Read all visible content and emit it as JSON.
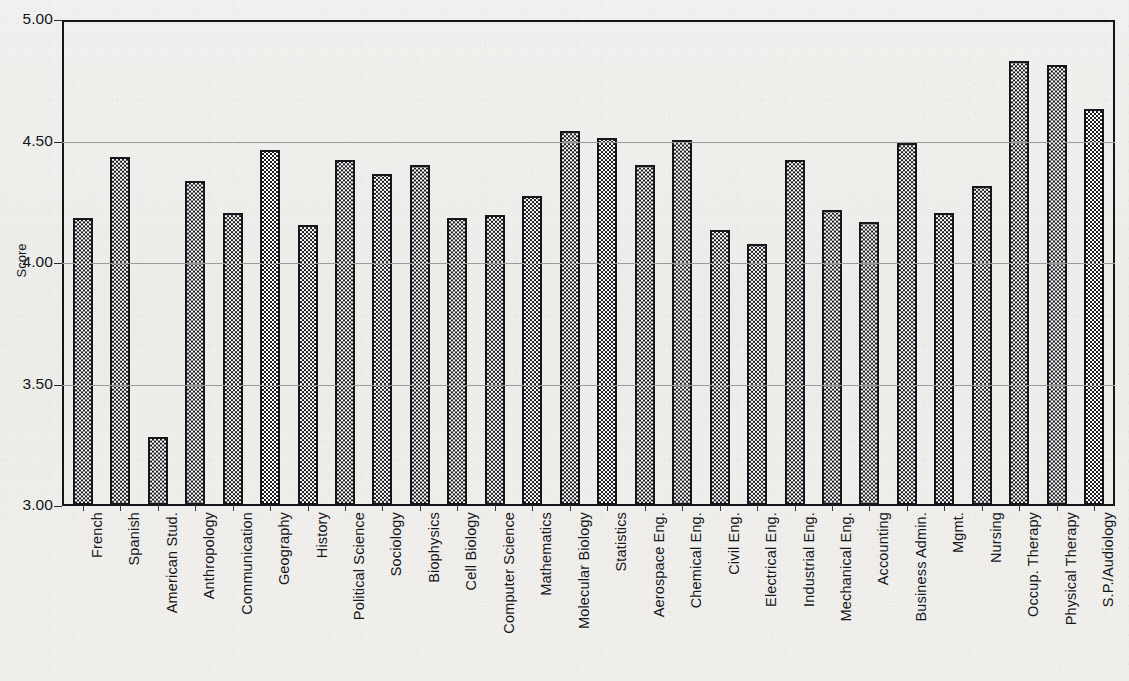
{
  "chart_data": {
    "type": "bar",
    "title": "",
    "xlabel": "",
    "ylabel": "Score",
    "ylim": [
      3.0,
      5.0
    ],
    "ytick_labels": [
      "5.00",
      "4.50",
      "4.00",
      "3.50",
      "3.00"
    ],
    "ytick_values": [
      5.0,
      4.5,
      4.0,
      3.5,
      3.0
    ],
    "grid": true,
    "legend": null,
    "categories": [
      "French",
      "Spanish",
      "American Stud.",
      "Anthropology",
      "Communication",
      "Geography",
      "History",
      "Political  Science",
      "Sociology",
      "Biophysics",
      "Cell Biology",
      "Computer Science",
      "Mathematics",
      "Molecular Biology",
      "Statistics",
      "Aerospace Eng.",
      "Chemical Eng.",
      "Civil Eng.",
      "Electrical Eng.",
      "Industrial Eng.",
      "Mechanical Eng.",
      "Accounting",
      "Business Admin.",
      "Mgmt.",
      "Nursing",
      "Occup. Therapy",
      "Physical Therapy",
      "S.P./Audiology"
    ],
    "values": [
      4.19,
      4.44,
      3.28,
      4.34,
      4.21,
      4.47,
      4.16,
      4.43,
      4.37,
      4.41,
      4.19,
      4.2,
      4.28,
      4.55,
      4.52,
      4.41,
      4.51,
      4.14,
      4.08,
      4.43,
      4.22,
      4.17,
      4.5,
      4.21,
      4.32,
      4.84,
      4.82,
      4.64
    ],
    "bar_style": {
      "fill_pattern": "checkerboard",
      "fill_color": "#1a1b1f",
      "background_color": "#ffffff",
      "border_color": "#16171b"
    }
  },
  "figure": {
    "background_color": "#f0efec",
    "frame_color": "#15161a",
    "gridline_color": "#9b9c9a"
  }
}
